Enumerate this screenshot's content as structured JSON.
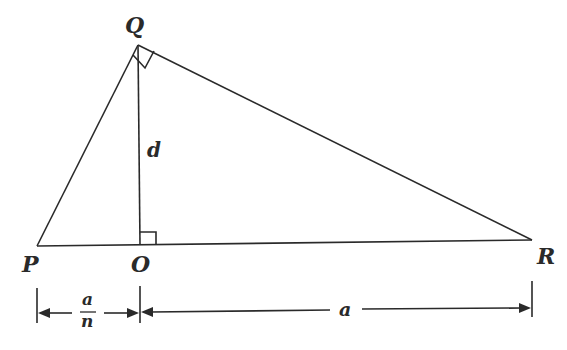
{
  "diagram": {
    "type": "right triangle with altitude",
    "points": {
      "P": {
        "label": "P",
        "x": 37,
        "y": 246
      },
      "O": {
        "label": "O",
        "x": 140,
        "y": 245
      },
      "Q": {
        "label": "Q",
        "x": 138,
        "y": 45
      },
      "R": {
        "label": "R",
        "x": 532,
        "y": 240
      }
    },
    "segment_labels": {
      "altitude": "d"
    },
    "dimensions": {
      "PO": {
        "numerator": "a",
        "denominator": "n"
      },
      "OR": {
        "label": "a"
      }
    },
    "right_angles": [
      "Q",
      "O"
    ]
  }
}
